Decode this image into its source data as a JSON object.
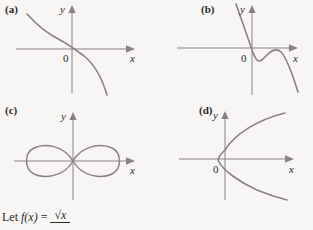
{
  "background_color": "#f7f6f5",
  "curve_color": "#8a8086",
  "axis_color": "#8a8086",
  "text_color": "#2b2b2b",
  "panels": [
    {
      "id": "a",
      "label": "(a)",
      "axis_x_label": "x",
      "axis_y_label": "y",
      "origin_label": "0",
      "curve_description": "decreasing-s-curve"
    },
    {
      "id": "b",
      "label": "(b)",
      "axis_x_label": "x",
      "axis_y_label": "y",
      "origin_label": "0",
      "curve_description": "steep-line-then-hump"
    },
    {
      "id": "c",
      "label": "(c)",
      "axis_x_label": "x",
      "axis_y_label": "y",
      "origin_label": "0",
      "curve_description": "lemniscate-figure-eight"
    },
    {
      "id": "d",
      "label": "(d)",
      "axis_x_label": "x",
      "axis_y_label": "y",
      "origin_label": "0",
      "curve_description": "rightward-opening-parabola"
    }
  ],
  "caption": {
    "prefix": "Let",
    "function": "f(x)",
    "equals": "=",
    "numerator": "√x",
    "denominator": ""
  }
}
